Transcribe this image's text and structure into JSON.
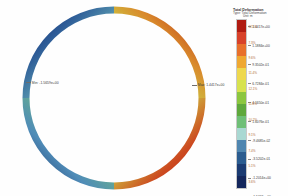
{
  "chart_data": {
    "type": "heatmap",
    "title": "Total Deformation",
    "subtitle": "Type: Total Deformation",
    "unit": "Unit: m",
    "colormap": "jet-discrete-12",
    "legend_position": "right",
    "grid": false,
    "axis_ranges": {
      "vmin": -1.5659,
      "vmax": 1.4417
    },
    "annotations": [
      {
        "name": "min",
        "label": "Min: -1.5659e+00",
        "value": -1.5659,
        "x": 0.08,
        "y": 0.5
      },
      {
        "name": "max",
        "label": "Max: 1.4417e+00",
        "value": 1.4417,
        "x": 0.92,
        "y": 0.52
      }
    ],
    "legend_ticks": [
      "1.4417e+00",
      "1.1884e+00",
      "9.3502e-01",
      "6.7284e-01",
      "4.1650e-01",
      "1.6076e-01",
      "-9.4685e-02",
      "-3.5202e-01",
      "-1.2014e+00",
      "-1.5659e+00"
    ],
    "legend_band_labels": [
      "12.5%",
      "7.3%",
      "9.6%",
      "11.4%",
      "12.1%",
      "11.8%",
      "10.2%",
      "9.1%",
      "7.4%",
      "5.1%",
      "3.6%"
    ],
    "legend_band_colors": [
      "#b01c12",
      "#d8422a",
      "#e8702c",
      "#efa832",
      "#eed84e",
      "#d7e24f",
      "#8cc63f",
      "#5fa83c",
      "#6fbf77",
      "#a9d8d2",
      "#4f86b0",
      "#2b5c90",
      "#1b3b72",
      "#14275c"
    ],
    "ring": {
      "shape": "circle",
      "center_x": 114,
      "center_y": 98,
      "radius": 88,
      "thickness": 7,
      "gradient_stops": [
        {
          "angle": 0,
          "color": "#b31b10"
        },
        {
          "angle": 35,
          "color": "#cf3a1e"
        },
        {
          "angle": 62,
          "color": "#d9c93e"
        },
        {
          "angle": 85,
          "color": "#8fc63f"
        },
        {
          "angle": 110,
          "color": "#5da93c"
        },
        {
          "angle": 140,
          "color": "#63b586"
        },
        {
          "angle": 160,
          "color": "#5e9fc0"
        },
        {
          "angle": 175,
          "color": "#2f5f9e"
        },
        {
          "angle": 180,
          "color": "#15275e"
        },
        {
          "angle": 200,
          "color": "#1e3a74"
        },
        {
          "angle": 220,
          "color": "#4b86b4"
        },
        {
          "angle": 245,
          "color": "#76bfa8"
        },
        {
          "angle": 270,
          "color": "#62ac3f"
        },
        {
          "angle": 295,
          "color": "#8cc63f"
        },
        {
          "angle": 320,
          "color": "#d4d046"
        },
        {
          "angle": 345,
          "color": "#cb3c1d"
        },
        {
          "angle": 360,
          "color": "#b31b10"
        }
      ]
    }
  },
  "legend": {
    "title": "Total Deformation",
    "subtitle": "Type: Total Deformation",
    "unit": "Unit: m"
  }
}
